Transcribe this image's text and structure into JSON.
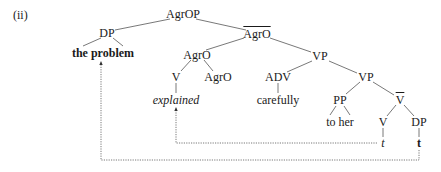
{
  "example_label": "(ii)",
  "tree": {
    "root": "AgrOP",
    "nodes": {
      "agrop": "AgrOP",
      "dp_spec": "DP",
      "the_problem": "the problem",
      "agro_bar": "AgrO",
      "agro_mid": "AgrO",
      "v_left": "V",
      "explained": "explained",
      "agro_head": "AgrO",
      "vp1": "VP",
      "adv": "ADV",
      "carefully": "carefully",
      "vp2": "VP",
      "pp": "PP",
      "to_her": "to her",
      "v_bar": "V",
      "v_trace_node": "V",
      "v_trace": "t",
      "dp_obj": "DP",
      "dp_trace": "t"
    },
    "movement_arrows": [
      {
        "from": "t (under V)",
        "to": "explained",
        "style": "dotted"
      },
      {
        "from": "t (under DP)",
        "to": "the problem",
        "style": "dotted"
      }
    ]
  }
}
